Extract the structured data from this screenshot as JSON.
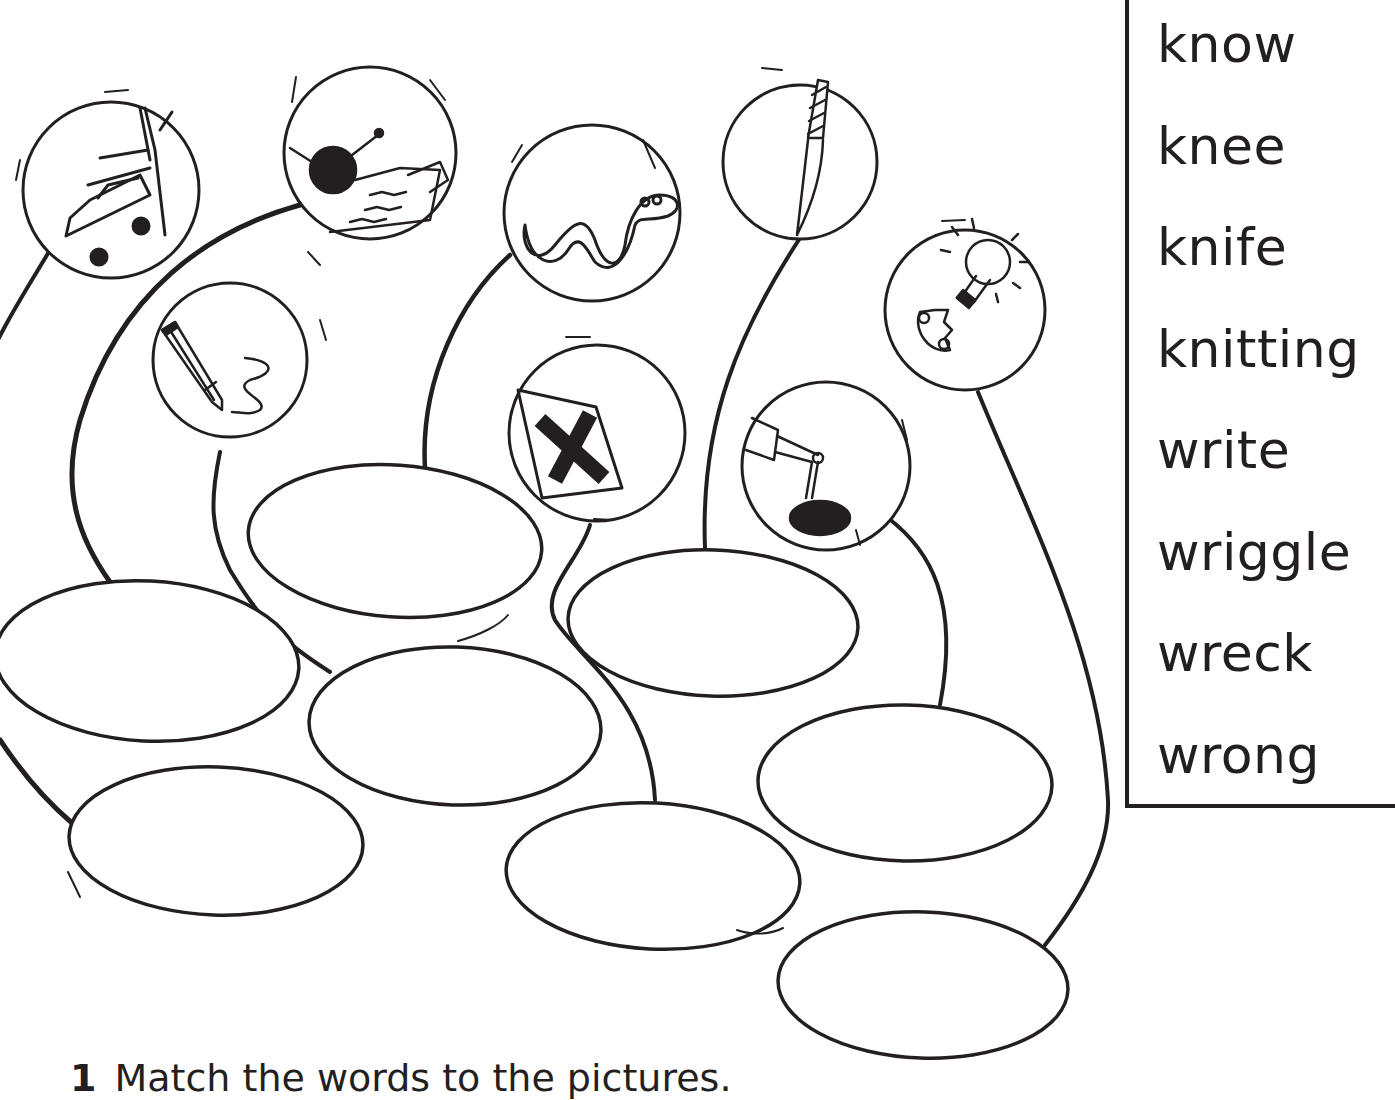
{
  "word_box": {
    "words": [
      "know",
      "knee",
      "knife",
      "knitting",
      "write",
      "wriggle",
      "wreck",
      "wrong"
    ]
  },
  "instruction": {
    "number": "1",
    "text": "Match the words to the pictures."
  },
  "pictures": [
    {
      "id": "wreck",
      "icon": "car-wreck-icon"
    },
    {
      "id": "knitting",
      "icon": "knitting-icon"
    },
    {
      "id": "write",
      "icon": "pencil-icon"
    },
    {
      "id": "wriggle",
      "icon": "snake-icon"
    },
    {
      "id": "wrong",
      "icon": "cross-icon"
    },
    {
      "id": "knife",
      "icon": "knife-icon"
    },
    {
      "id": "knee",
      "icon": "knee-icon"
    },
    {
      "id": "know",
      "icon": "lightbulb-idea-icon"
    }
  ],
  "answer_ovals": 8,
  "colors": {
    "ink": "#231f20",
    "paper": "#ffffff"
  }
}
